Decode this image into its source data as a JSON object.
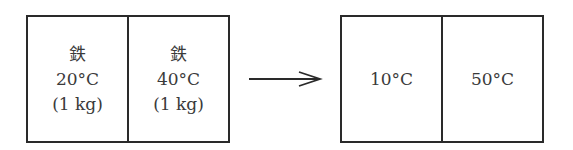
{
  "before": {
    "cells": [
      {
        "material": "鉄",
        "temperature": "20°C",
        "mass": "(1 kg)"
      },
      {
        "material": "鉄",
        "temperature": "40°C",
        "mass": "(1 kg)"
      }
    ]
  },
  "arrow": {
    "icon": "right-arrow-icon"
  },
  "after": {
    "cells": [
      {
        "temperature": "10°C"
      },
      {
        "temperature": "50°C"
      }
    ]
  },
  "colors": {
    "stroke": "#2a2a2a",
    "text": "#3a3a3a",
    "background": "#ffffff"
  }
}
